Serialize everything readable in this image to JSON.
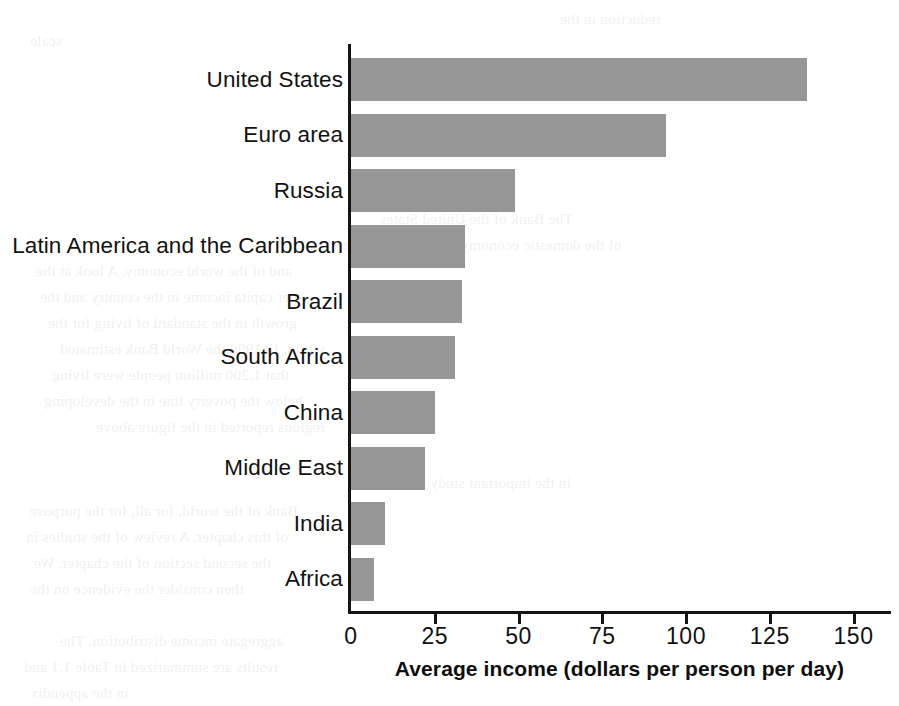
{
  "chart_data": {
    "type": "bar",
    "orientation": "horizontal",
    "title": "",
    "xlabel": "Average income (dollars per person per day)",
    "ylabel": "",
    "categories": [
      "United States",
      "Euro area",
      "Russia",
      "Latin America and the Caribbean",
      "Brazil",
      "South Africa",
      "China",
      "Middle East",
      "India",
      "Africa"
    ],
    "values": [
      136,
      94,
      49,
      34,
      33,
      31,
      25,
      22,
      10,
      7
    ],
    "xticks": [
      0,
      25,
      50,
      75,
      100,
      125,
      150
    ],
    "xtick_labels": [
      "0",
      "25",
      "50",
      "75",
      "100",
      "125",
      "150"
    ],
    "xlim": [
      0,
      160
    ],
    "grid": false,
    "legend": false,
    "bar_color": "#969696",
    "axis_color": "#141414",
    "background": "#ffffff"
  },
  "bleed_text": {
    "lines": [
      "reduction in the",
      "scale",
      "The Bank of the United States",
      "of the domestic economy of the United States",
      "and of the world economy. A look at the",
      "per capita income in the country and the",
      "growth in the standard of living for the",
      "world. In 1990 the World Bank estimated",
      "that 1,200 million people were living",
      "below the poverty line in the developing",
      "regions reported in the figure above",
      "in the important study",
      "Bank of the world, for all, for the purpose",
      "of this chapter. A review of the studies in",
      "the second section of the chapter. We",
      "then consider the evidence on the",
      "aggregate income distribution. The",
      "results are summarized in Table 1.1 and",
      "in the appendix"
    ]
  }
}
